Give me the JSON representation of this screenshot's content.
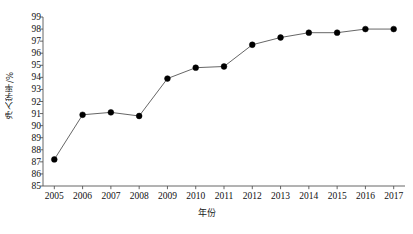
{
  "chart_data": {
    "type": "line",
    "title": "",
    "xlabel": "年份",
    "ylabel": "净入学率/%",
    "categories": [
      "2005",
      "2006",
      "2007",
      "2008",
      "2009",
      "2010",
      "2011",
      "2012",
      "2013",
      "2014",
      "2015",
      "2016",
      "2017"
    ],
    "x": [
      2005,
      2006,
      2007,
      2008,
      2009,
      2010,
      2011,
      2012,
      2013,
      2014,
      2015,
      2016,
      2017
    ],
    "values": [
      87.2,
      90.9,
      91.1,
      90.8,
      93.9,
      94.8,
      94.9,
      96.7,
      97.3,
      97.7,
      97.7,
      98.0,
      98.0
    ],
    "series": [
      {
        "name": "净入学率",
        "values": [
          87.2,
          90.9,
          91.1,
          90.8,
          93.9,
          94.8,
          94.9,
          96.7,
          97.3,
          97.7,
          97.7,
          98.0,
          98.0
        ]
      }
    ],
    "ylim": [
      85,
      99
    ],
    "xlim": [
      2004.6,
      2017.4
    ],
    "yticks": [
      85,
      86,
      87,
      88,
      89,
      90,
      91,
      92,
      93,
      94,
      95,
      96,
      97,
      98,
      99
    ],
    "ytick_labels": [
      "85",
      "86",
      "87",
      "88",
      "89",
      "90",
      "91",
      "92",
      "93",
      "94",
      "95",
      "96",
      "97",
      "98",
      "99"
    ],
    "xticks": [
      2005,
      2006,
      2007,
      2008,
      2009,
      2010,
      2011,
      2012,
      2013,
      2014,
      2015,
      2016,
      2017
    ],
    "xtick_labels": [
      "2005",
      "2006",
      "2007",
      "2008",
      "2009",
      "2010",
      "2011",
      "2012",
      "2013",
      "2014",
      "2015",
      "2016",
      "2017"
    ],
    "grid": false,
    "legend": null,
    "legend_position": "none",
    "marker": "filled-circle",
    "marker_color": "#000000",
    "line_color": "#555555",
    "axis_color": "#555555",
    "background": "#ffffff"
  }
}
